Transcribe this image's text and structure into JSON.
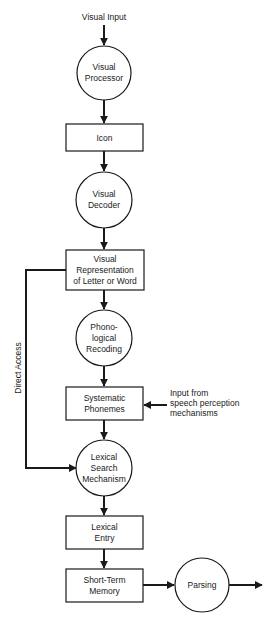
{
  "diagram": {
    "type": "flowchart",
    "input_label": "Visual Input",
    "nodes": [
      {
        "id": "visual_processor",
        "shape": "circle",
        "lines": [
          "Visual",
          "Processor"
        ]
      },
      {
        "id": "icon",
        "shape": "box",
        "lines": [
          "Icon"
        ]
      },
      {
        "id": "visual_decoder",
        "shape": "circle",
        "lines": [
          "Visual",
          "Decoder"
        ]
      },
      {
        "id": "visual_representation",
        "shape": "box",
        "lines": [
          "Visual",
          "Representation",
          "of Letter or Word"
        ]
      },
      {
        "id": "phonological_recoding",
        "shape": "circle",
        "lines": [
          "Phono-",
          "logical",
          "Recoding"
        ]
      },
      {
        "id": "systematic_phonemes",
        "shape": "box",
        "lines": [
          "Systematic",
          "Phonemes"
        ]
      },
      {
        "id": "lexical_search",
        "shape": "circle",
        "lines": [
          "Lexical",
          "Search",
          "Mechanism"
        ]
      },
      {
        "id": "lexical_entry",
        "shape": "box",
        "lines": [
          "Lexical",
          "Entry"
        ]
      },
      {
        "id": "short_term_memory",
        "shape": "box",
        "lines": [
          "Short-Term",
          "Memory"
        ]
      },
      {
        "id": "parsing",
        "shape": "circle",
        "lines": [
          "Parsing"
        ]
      }
    ],
    "side_input": {
      "lines": [
        "Input from",
        "speech perception",
        "mechanisms"
      ],
      "target": "systematic_phonemes"
    },
    "bypass": {
      "label": "Direct Access",
      "from": "visual_representation",
      "to": "lexical_search"
    },
    "edges": [
      [
        "visual_input",
        "visual_processor"
      ],
      [
        "visual_processor",
        "icon"
      ],
      [
        "icon",
        "visual_decoder"
      ],
      [
        "visual_decoder",
        "visual_representation"
      ],
      [
        "visual_representation",
        "phonological_recoding"
      ],
      [
        "phonological_recoding",
        "systematic_phonemes"
      ],
      [
        "speech_perception_input",
        "systematic_phonemes"
      ],
      [
        "systematic_phonemes",
        "lexical_search"
      ],
      [
        "visual_representation",
        "lexical_search"
      ],
      [
        "lexical_search",
        "lexical_entry"
      ],
      [
        "lexical_entry",
        "short_term_memory"
      ],
      [
        "short_term_memory",
        "parsing"
      ],
      [
        "parsing",
        "output"
      ]
    ]
  }
}
